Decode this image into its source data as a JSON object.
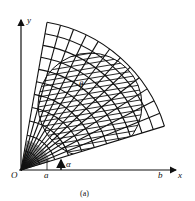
{
  "figure": {
    "caption": "(a)",
    "axes": {
      "x_label": "x",
      "y_label": "y",
      "origin_label": "O"
    },
    "annotations": {
      "x_tick_a": "a",
      "x_tick_b": "b",
      "arrow_label": "α",
      "angle_label": "β",
      "region_label": "θ"
    },
    "mesh": {
      "description": "fan-shaped polar grid with inner densely hatched circular region",
      "start_angle_deg": 17,
      "end_angle_deg": 80,
      "outer_radius_px": 150,
      "radial_lines": 12,
      "arcs": 11
    },
    "colors": {
      "ink": "#111111",
      "background": "#ffffff"
    }
  }
}
